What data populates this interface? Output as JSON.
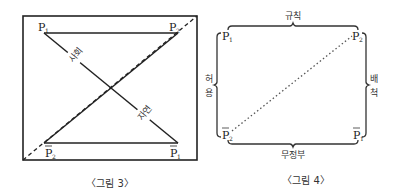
{
  "figure3": {
    "caption": "〈그림 3〉",
    "corners": {
      "top_left": {
        "base": "P",
        "sub": "1",
        "bar": false
      },
      "top_right": {
        "base": "P",
        "sub": "2",
        "bar": false
      },
      "bottom_left": {
        "base": "P",
        "sub": "2",
        "bar": true
      },
      "bottom_right": {
        "base": "P",
        "sub": "1",
        "bar": true
      }
    },
    "diagonal_labels": {
      "upper": "사회",
      "lower": "자연"
    },
    "colors": {
      "line": "#222222",
      "frame": "#222222"
    }
  },
  "figure4": {
    "caption": "〈그림 4〉",
    "corners": {
      "top_left": {
        "base": "P",
        "sub": "1",
        "bar": false
      },
      "top_right": {
        "base": "P",
        "sub": "2",
        "bar": false
      },
      "bottom_left": {
        "base": "P",
        "sub": "2",
        "bar": true
      },
      "bottom_right": {
        "base": "P",
        "sub": "1",
        "bar": true
      }
    },
    "bracket_labels": {
      "top": "규칙",
      "bottom": "무정부",
      "left_1": "허",
      "left_2": "용",
      "right_1": "배",
      "right_2": "척"
    },
    "colors": {
      "line": "#333333",
      "dotted": "#555555"
    }
  }
}
